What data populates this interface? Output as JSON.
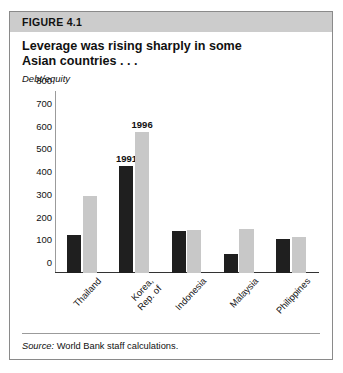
{
  "figure": {
    "header_label": "FIGURE 4.1",
    "title_line1": "Leverage was rising sharply in some",
    "title_line2": "Asian countries . . .",
    "source_prefix": "Source:",
    "source_text": "World Bank staff calculations."
  },
  "colors": {
    "header_band": "#cccccc",
    "series_1991": "#1f1f1f",
    "series_1996": "#c8c8c8",
    "border": "#8a8a8a",
    "axis": "#333333"
  },
  "chart_data": {
    "type": "bar",
    "title": "Leverage was rising sharply in some Asian countries . . .",
    "xlabel": "",
    "ylabel": "Debt/equity",
    "ylim": [
      0,
      800
    ],
    "yticks": [
      0,
      100,
      200,
      300,
      400,
      500,
      600,
      700,
      800
    ],
    "ytick_labels": [
      "0",
      "100",
      "200",
      "300",
      "400",
      "500",
      "600",
      "700",
      "800"
    ],
    "grid": false,
    "legend": "annotated-above-bars",
    "categories": [
      "Thailand",
      "Korea,\nRep. of",
      "Indonesia",
      "Malaysia",
      "Philippines"
    ],
    "category_labels": [
      {
        "line1": "Thailand",
        "line2": ""
      },
      {
        "line1": "Korea,",
        "line2": "Rep. of"
      },
      {
        "line1": "Indonesia",
        "line2": ""
      },
      {
        "line1": "Malaysia",
        "line2": ""
      },
      {
        "line1": "Philippines",
        "line2": ""
      }
    ],
    "series": [
      {
        "name": "1991",
        "color": "#1f1f1f",
        "values": [
          165,
          470,
          185,
          85,
          148
        ]
      },
      {
        "name": "1996",
        "color": "#c8c8c8",
        "values": [
          340,
          620,
          190,
          195,
          160
        ]
      }
    ],
    "annotations": [
      {
        "text": "1991",
        "series": "1991",
        "category": "Korea, Rep. of"
      },
      {
        "text": "1996",
        "series": "1996",
        "category": "Korea, Rep. of"
      }
    ]
  }
}
